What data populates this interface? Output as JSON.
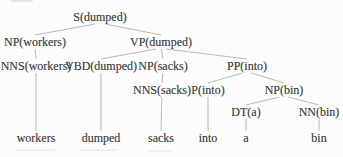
{
  "figure": {
    "colors": {
      "background": "#fcfcfa",
      "text": "#45454b",
      "edge": "#a8a8a8"
    }
  },
  "tree": {
    "nodes": [
      {
        "id": "s",
        "label": "S(dumped)",
        "x": 100,
        "y": 17,
        "leaf": false
      },
      {
        "id": "np-workers",
        "label": "NP(workers)",
        "x": 35,
        "y": 42,
        "leaf": false
      },
      {
        "id": "vp",
        "label": "VP(dumped)",
        "x": 161,
        "y": 42,
        "leaf": false
      },
      {
        "id": "nns-workers",
        "label": "NNS(workers)",
        "x": 36,
        "y": 66,
        "leaf": false
      },
      {
        "id": "vbd",
        "label": "VBD(dumped)",
        "x": 101,
        "y": 66,
        "leaf": false
      },
      {
        "id": "np-sacks",
        "label": "NP(sacks)",
        "x": 163,
        "y": 66,
        "leaf": false
      },
      {
        "id": "pp",
        "label": "PP(into)",
        "x": 247,
        "y": 66,
        "leaf": false
      },
      {
        "id": "nns-sacks",
        "label": "NNS(sacks)",
        "x": 162,
        "y": 90,
        "leaf": false
      },
      {
        "id": "p",
        "label": "P(into)",
        "x": 208,
        "y": 90,
        "leaf": false
      },
      {
        "id": "np-bin",
        "label": "NP(bin)",
        "x": 284,
        "y": 90,
        "leaf": false
      },
      {
        "id": "dt",
        "label": "DT(a)",
        "x": 246,
        "y": 112,
        "leaf": false
      },
      {
        "id": "nn",
        "label": "NN(bin)",
        "x": 319,
        "y": 112,
        "leaf": false
      },
      {
        "id": "word-workers",
        "label": "workers",
        "x": 36,
        "y": 138,
        "leaf": true
      },
      {
        "id": "word-dumped",
        "label": "dumped",
        "x": 101,
        "y": 138,
        "leaf": true
      },
      {
        "id": "word-sacks",
        "label": "sacks",
        "x": 161,
        "y": 138,
        "leaf": true
      },
      {
        "id": "word-into",
        "label": "into",
        "x": 208,
        "y": 138,
        "leaf": true
      },
      {
        "id": "word-a",
        "label": "a",
        "x": 246,
        "y": 138,
        "leaf": true
      },
      {
        "id": "word-bin",
        "label": "bin",
        "x": 319,
        "y": 138,
        "leaf": true
      }
    ],
    "edges": [
      {
        "from": "s",
        "to": "np-workers"
      },
      {
        "from": "s",
        "to": "vp"
      },
      {
        "from": "np-workers",
        "to": "nns-workers"
      },
      {
        "from": "vp",
        "to": "vbd"
      },
      {
        "from": "vp",
        "to": "np-sacks"
      },
      {
        "from": "vp",
        "to": "pp"
      },
      {
        "from": "np-sacks",
        "to": "nns-sacks"
      },
      {
        "from": "pp",
        "to": "p"
      },
      {
        "from": "pp",
        "to": "np-bin"
      },
      {
        "from": "np-bin",
        "to": "dt"
      },
      {
        "from": "np-bin",
        "to": "nn"
      },
      {
        "from": "nns-workers",
        "to": "word-workers"
      },
      {
        "from": "vbd",
        "to": "word-dumped"
      },
      {
        "from": "nns-sacks",
        "to": "word-sacks"
      },
      {
        "from": "p",
        "to": "word-into"
      },
      {
        "from": "dt",
        "to": "word-a"
      },
      {
        "from": "nn",
        "to": "word-bin"
      }
    ]
  }
}
